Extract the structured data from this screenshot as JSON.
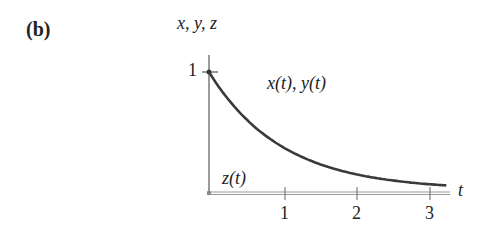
{
  "panel": {
    "label": "(b)"
  },
  "chart_data": {
    "type": "line",
    "title": "",
    "ylabel": "x, y, z",
    "xlabel": "t",
    "xticks": [
      "1",
      "2",
      "3"
    ],
    "yticks": [
      "1"
    ],
    "xlim": [
      0,
      3.3
    ],
    "ylim": [
      0,
      1.1
    ],
    "grid": false,
    "series": [
      {
        "name": "x(t), y(t)",
        "x": [
          0,
          0.25,
          0.5,
          0.75,
          1.0,
          1.25,
          1.5,
          1.75,
          2.0,
          2.25,
          2.5,
          2.75,
          3.0,
          3.25
        ],
        "values": [
          1.0,
          0.78,
          0.61,
          0.47,
          0.37,
          0.29,
          0.22,
          0.17,
          0.14,
          0.11,
          0.08,
          0.06,
          0.05,
          0.04
        ]
      },
      {
        "name": "z(t)",
        "x": [
          0,
          3.25
        ],
        "values": [
          0,
          0
        ]
      }
    ],
    "annotations": [
      "x(t), y(t)",
      "z(t)"
    ]
  },
  "colors": {
    "curve": "#3a3a3a",
    "axis": "#7a7a7a",
    "z_line": "#9a9a9a"
  }
}
